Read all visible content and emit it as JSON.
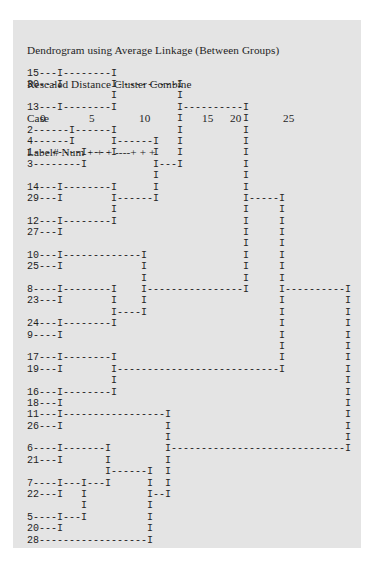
{
  "title": "Dendrogram using Average Linkage (Between Groups)",
  "subtitle": "Rescaled Distance Cluster Combine",
  "scale": {
    "label": "Case",
    "ticks": [
      {
        "value": "0",
        "x": 40
      },
      {
        "value": "5",
        "x": 89
      },
      {
        "value": "10",
        "x": 139
      },
      {
        "value": "15",
        "x": 202
      },
      {
        "value": "20",
        "x": 230
      },
      {
        "value": "25",
        "x": 283
      }
    ]
  },
  "axis_row": "Label# Num + + + ----+ + +",
  "rows": [
    "15---I--------I",
    "30---I        I----------I",
    "              I          I",
    "13---I--------I          I----------I",
    "                         I          I",
    "2------I------I          I          I",
    "4------I      I------I   I          I",
    "1--------I----I      I   I          I",
    "3--------I           I---I          I",
    "                     I              I",
    "14---I--------I      I              I",
    "29---I        I------I              I-----I",
    "              I                     I     I",
    "12---I--------I                     I     I",
    "27---I                              I     I",
    "                                    I     I",
    "10---I-------------I                I     I",
    "25---I             I                I     I",
    "                   I                I     I",
    "8----I--------I    I----------------I     I----------I",
    "23---I        I    I                      I          I",
    "              I----I                      I          I",
    "24---I--------I                           I          I",
    "9----I                                    I          I",
    "                                          I          I",
    "17---I--------I                           I          I",
    "19---I        I---------------------------I          I",
    "              I                                      I",
    "16---I--------I                                      I",
    "18---I                                               I",
    "11---I-----------------I                             I",
    "26---I                 I                             I",
    "                       I                             I",
    "6----I-------I         I-----------------------------I",
    "21---I       I         I",
    "             I------I  I",
    "7----I---I---I      I  I",
    "22---I   I          I--I",
    "         I          I",
    "5----I---I          I",
    "20---I              I",
    "28------------------I"
  ]
}
